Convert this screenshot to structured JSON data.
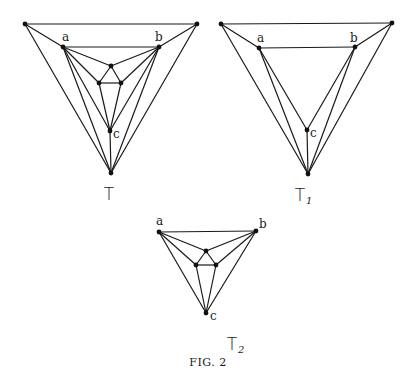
{
  "caption": "Fig. 2",
  "caption_display": "FIG. 2",
  "colors": {
    "ink": "#1a1a1a",
    "background": "#ffffff"
  },
  "graphs": [
    {
      "id": "T",
      "label": "T",
      "subscript": "",
      "label_pos": [
        109,
        200
      ],
      "vertices": {
        "OL": [
          25,
          24
        ],
        "OR": [
          197,
          24
        ],
        "B": [
          111,
          173
        ],
        "a": [
          63,
          47
        ],
        "b": [
          159,
          47
        ],
        "it": [
          111,
          66
        ],
        "il": [
          99,
          83
        ],
        "ir": [
          121,
          83
        ],
        "c": [
          110,
          131
        ]
      },
      "vertex_labels": [
        {
          "text": "a",
          "pos": [
            62,
            41
          ]
        },
        {
          "text": "b",
          "pos": [
            155,
            41
          ]
        },
        {
          "text": "c",
          "pos": [
            113,
            138
          ]
        }
      ],
      "edges": [
        [
          "OL",
          "OR"
        ],
        [
          "OL",
          "a"
        ],
        [
          "OR",
          "b"
        ],
        [
          "OL",
          "B"
        ],
        [
          "OR",
          "B"
        ],
        [
          "a",
          "b"
        ],
        [
          "a",
          "it"
        ],
        [
          "b",
          "it"
        ],
        [
          "a",
          "il"
        ],
        [
          "b",
          "ir"
        ],
        [
          "it",
          "il"
        ],
        [
          "it",
          "ir"
        ],
        [
          "il",
          "ir"
        ],
        [
          "a",
          "c"
        ],
        [
          "il",
          "c"
        ],
        [
          "ir",
          "c"
        ],
        [
          "b",
          "c"
        ],
        [
          "c",
          "B"
        ],
        [
          "a",
          "B"
        ],
        [
          "b",
          "B"
        ]
      ]
    },
    {
      "id": "T1",
      "label": "T",
      "subscript": "1",
      "label_pos": [
        300,
        201
      ],
      "vertices": {
        "OL": [
          221,
          24
        ],
        "OR": [
          392,
          23
        ],
        "B": [
          308,
          174
        ],
        "a": [
          259,
          48
        ],
        "b": [
          355,
          47
        ],
        "c": [
          307,
          130
        ]
      },
      "vertex_labels": [
        {
          "text": "a",
          "pos": [
            257,
            42
          ]
        },
        {
          "text": "b",
          "pos": [
            350,
            42
          ]
        },
        {
          "text": "c",
          "pos": [
            310,
            137
          ]
        }
      ],
      "edges": [
        [
          "OL",
          "OR"
        ],
        [
          "OL",
          "a"
        ],
        [
          "OR",
          "b"
        ],
        [
          "OL",
          "B"
        ],
        [
          "OR",
          "B"
        ],
        [
          "a",
          "b"
        ],
        [
          "a",
          "c"
        ],
        [
          "b",
          "c"
        ],
        [
          "a",
          "B"
        ],
        [
          "b",
          "B"
        ],
        [
          "c",
          "B"
        ]
      ]
    },
    {
      "id": "T2",
      "label": "T",
      "subscript": "2",
      "label_pos": [
        232,
        350
      ],
      "vertices": {
        "a": [
          159,
          232
        ],
        "b": [
          256,
          231
        ],
        "it": [
          206,
          251
        ],
        "il": [
          196,
          265
        ],
        "ir": [
          216,
          265
        ],
        "c": [
          206,
          313
        ]
      },
      "vertex_labels": [
        {
          "text": "a",
          "pos": [
            156,
            225
          ]
        },
        {
          "text": "b",
          "pos": [
            259,
            228
          ]
        },
        {
          "text": "c",
          "pos": [
            210,
            320
          ]
        }
      ],
      "edges": [
        [
          "a",
          "b"
        ],
        [
          "a",
          "it"
        ],
        [
          "b",
          "it"
        ],
        [
          "a",
          "il"
        ],
        [
          "b",
          "ir"
        ],
        [
          "it",
          "il"
        ],
        [
          "it",
          "ir"
        ],
        [
          "il",
          "ir"
        ],
        [
          "a",
          "c"
        ],
        [
          "il",
          "c"
        ],
        [
          "ir",
          "c"
        ],
        [
          "b",
          "c"
        ]
      ]
    }
  ]
}
